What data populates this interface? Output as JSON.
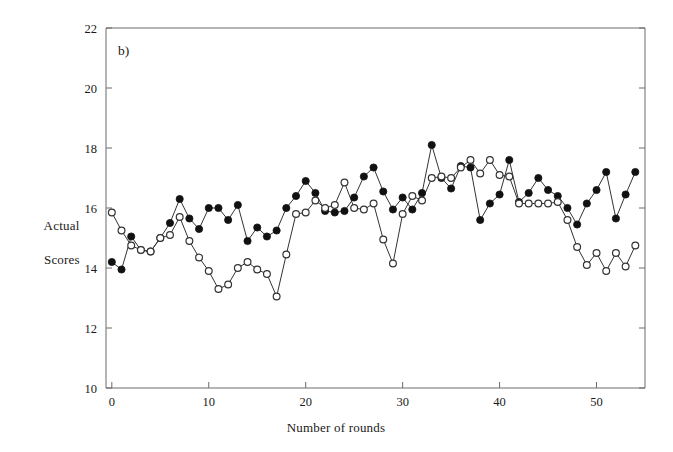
{
  "figure": {
    "panel_label": "b)",
    "background_color": "#ffffff",
    "line_color": "#333333",
    "filled_marker_color": "#111111",
    "open_marker_fill": "#ffffff",
    "open_marker_stroke": "#333333"
  },
  "axes": {
    "y_title_line1": "Actual",
    "y_title_line2": "Scores",
    "x_title": "Number of rounds",
    "y_ticks": [
      "10",
      "12",
      "14",
      "16",
      "18",
      "20",
      "22"
    ],
    "x_ticks": [
      "0",
      "10",
      "20",
      "30",
      "40",
      "50"
    ]
  },
  "chart_data": {
    "type": "line",
    "title": "b)",
    "xlabel": "Number of rounds",
    "ylabel": "Actual Scores",
    "xlim": [
      -0.6,
      55
    ],
    "ylim": [
      10,
      22
    ],
    "y_ticks": [
      10,
      12,
      14,
      16,
      18,
      20,
      22
    ],
    "x_ticks": [
      0,
      10,
      20,
      30,
      40,
      50
    ],
    "grid": false,
    "legend": "none",
    "markers": {
      "series_1": "filled-circle",
      "series_2": "open-circle"
    },
    "x": [
      0,
      1,
      2,
      3,
      4,
      5,
      6,
      7,
      8,
      9,
      10,
      11,
      12,
      13,
      14,
      15,
      16,
      17,
      18,
      19,
      20,
      21,
      22,
      23,
      24,
      25,
      26,
      27,
      28,
      29,
      30,
      31,
      32,
      33,
      34,
      35,
      36,
      37,
      38,
      39,
      40,
      41,
      42,
      43,
      44,
      45,
      46,
      47,
      48,
      49,
      50,
      51,
      52,
      53,
      54
    ],
    "series": [
      {
        "name": "Filled circles",
        "marker": "filled-circle",
        "values": [
          14.2,
          13.95,
          15.05,
          14.6,
          14.55,
          15.0,
          15.5,
          16.3,
          15.65,
          15.3,
          16.0,
          16.0,
          15.6,
          16.1,
          14.9,
          15.35,
          15.05,
          15.25,
          16.0,
          16.4,
          16.9,
          16.5,
          15.9,
          15.85,
          15.9,
          16.35,
          17.05,
          17.35,
          16.55,
          15.95,
          16.35,
          15.95,
          16.5,
          18.1,
          17.0,
          16.65,
          17.4,
          17.35,
          15.6,
          16.15,
          16.45,
          17.6,
          16.2,
          16.5,
          17.0,
          16.6,
          16.4,
          16.0,
          15.45,
          16.15,
          16.6,
          17.2,
          15.65,
          16.45,
          17.2
        ]
      },
      {
        "name": "Open circles",
        "marker": "open-circle",
        "values": [
          15.85,
          15.25,
          14.75,
          14.6,
          14.55,
          15.0,
          15.1,
          15.7,
          14.9,
          14.35,
          13.9,
          13.3,
          13.45,
          14.0,
          14.2,
          13.95,
          13.8,
          13.05,
          14.45,
          15.8,
          15.85,
          16.25,
          16.0,
          16.1,
          16.85,
          16.0,
          15.95,
          16.15,
          14.95,
          14.15,
          15.8,
          16.4,
          16.25,
          17.0,
          17.05,
          17.0,
          17.35,
          17.6,
          17.15,
          17.6,
          17.1,
          17.05,
          16.15,
          16.15,
          16.15,
          16.15,
          16.2,
          15.6,
          14.7,
          14.1,
          14.5,
          13.9,
          14.5,
          14.05,
          14.75
        ]
      }
    ]
  }
}
